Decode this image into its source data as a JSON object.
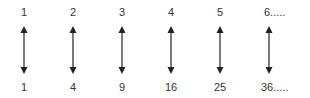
{
  "diagram": {
    "columns": [
      {
        "top": "1",
        "bottom": "1"
      },
      {
        "top": "2",
        "bottom": "4"
      },
      {
        "top": "3",
        "bottom": "9"
      },
      {
        "top": "4",
        "bottom": "16"
      },
      {
        "top": "5",
        "bottom": "25"
      },
      {
        "top": "6.....",
        "bottom": "36....."
      }
    ],
    "connector_icon": "double-headed-vertical-arrow",
    "arrow_color": "#333333"
  }
}
